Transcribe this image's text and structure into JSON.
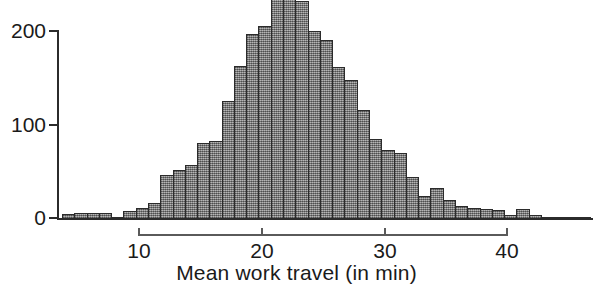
{
  "chart_data": {
    "type": "bar",
    "title": "",
    "xlabel": "Mean work travel (in min)",
    "ylabel": "",
    "xlim": [
      3.5,
      47.5
    ],
    "ylim": [
      0,
      234
    ],
    "grid": false,
    "legend": "none",
    "bin_width": 1,
    "note": "Histogram of mean work travel time; the three tallest bars are clipped by the top edge of the figure.",
    "x_ticks": [
      10,
      20,
      30,
      40
    ],
    "x_tick_labels": [
      "10",
      "20",
      "30",
      "40"
    ],
    "y_ticks": [
      0,
      100,
      200
    ],
    "y_tick_labels": [
      "0",
      "100",
      "200"
    ],
    "bar_color": "#8c8c8c",
    "bar_edge_color": "#2b2b2b",
    "axis_color": "#2b2b2b",
    "categories": [
      4,
      5,
      6,
      7,
      8,
      9,
      10,
      11,
      12,
      13,
      14,
      15,
      16,
      17,
      18,
      19,
      20,
      21,
      22,
      23,
      24,
      25,
      26,
      27,
      28,
      29,
      30,
      31,
      32,
      33,
      34,
      35,
      36,
      37,
      38,
      39,
      40,
      41,
      42,
      43,
      44,
      45,
      46
    ],
    "values": [
      5,
      6,
      6,
      6,
      2,
      8,
      12,
      17,
      47,
      52,
      57,
      81,
      83,
      126,
      163,
      197,
      205,
      240,
      245,
      232,
      200,
      190,
      162,
      148,
      116,
      85,
      73,
      70,
      45,
      25,
      33,
      20,
      14,
      12,
      11,
      10,
      4,
      11,
      4,
      1,
      1,
      2,
      1
    ]
  },
  "axis": {
    "y_labels": [
      "200",
      "100",
      "0"
    ],
    "x_labels": [
      "10",
      "20",
      "30",
      "40"
    ],
    "x_title": "Mean work travel (in min)"
  }
}
